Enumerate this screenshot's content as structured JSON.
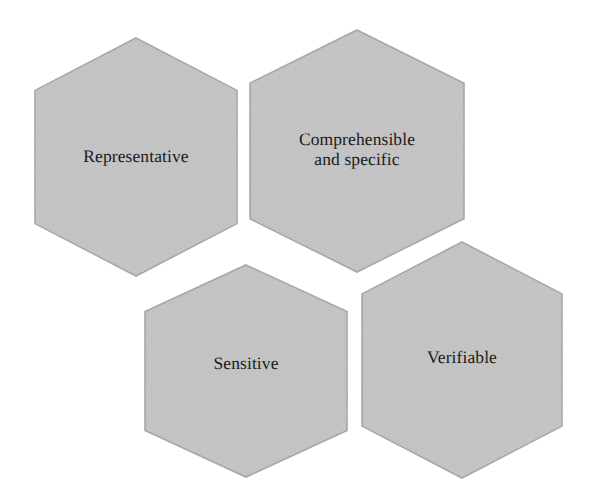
{
  "diagram": {
    "type": "hexagon-cluster",
    "background_color": "#ffffff",
    "shape_fill_color": "#c4c4c4",
    "shape_stroke_color": "#a6a6a6",
    "text_color": "#1b1b1b",
    "shapes": [
      {
        "id": "representative",
        "label": "Representative",
        "shape": "hexagon",
        "center_x": 136,
        "center_y": 157,
        "half_width": 101,
        "half_height": 119,
        "flat_ratio": 0.56
      },
      {
        "id": "comprehensible-and-specific",
        "label": "Comprehensible\nand specific",
        "shape": "hexagon",
        "center_x": 357,
        "center_y": 151,
        "half_width": 107,
        "half_height": 121,
        "flat_ratio": 0.56
      },
      {
        "id": "sensitive",
        "label": "Sensitive",
        "shape": "hexagon",
        "center_x": 246,
        "center_y": 371,
        "half_width": 101,
        "half_height": 106,
        "flat_ratio": 0.56
      },
      {
        "id": "verifiable",
        "label": "Verifiable",
        "shape": "hexagon",
        "center_x": 462,
        "center_y": 360,
        "half_width": 100,
        "half_height": 118,
        "flat_ratio": 0.56
      }
    ]
  }
}
